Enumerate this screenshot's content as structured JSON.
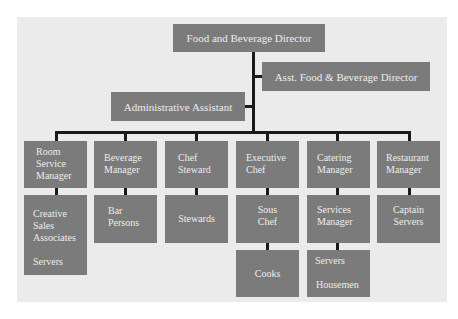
{
  "chart": {
    "top": {
      "director": "Food and Beverage Director",
      "assistant_director": "Asst. Food & Beverage Director",
      "admin_assistant": "Administrative Assistant"
    },
    "columns": [
      {
        "head": [
          "Room",
          "Service",
          "Manager"
        ],
        "children": [
          {
            "lines": [
              "Creative",
              "Sales",
              "Associates",
              "",
              "Servers"
            ]
          }
        ]
      },
      {
        "head": [
          "Beverage",
          "Manager"
        ],
        "children": [
          {
            "lines": [
              "Bar",
              "Persons"
            ]
          }
        ]
      },
      {
        "head": [
          "Chef",
          "Steward"
        ],
        "children": [
          {
            "lines": [
              "Stewards"
            ]
          }
        ]
      },
      {
        "head": [
          "Executive",
          "Chef"
        ],
        "children": [
          {
            "lines": [
              "Sous",
              "Chef"
            ]
          },
          {
            "lines": [
              "Cooks"
            ]
          }
        ]
      },
      {
        "head": [
          "Catering",
          "Manager"
        ],
        "children": [
          {
            "lines": [
              "Services",
              "Manager"
            ]
          },
          {
            "lines": [
              "Servers",
              "",
              "Housemen"
            ]
          }
        ]
      },
      {
        "head": [
          "Restaurant",
          "Manager"
        ],
        "children": [
          {
            "lines": [
              "Captain",
              "Servers"
            ]
          }
        ]
      }
    ]
  },
  "colors": {
    "box": "#7b7b7b",
    "box_text": "#ececec",
    "background": "#ebebeb",
    "connector": "#1a1a1a"
  }
}
